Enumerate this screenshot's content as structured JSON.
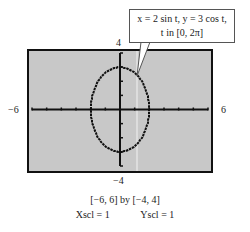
{
  "chart_data": {
    "type": "line",
    "title": "",
    "callout": {
      "line1": "x = 2 sin t, y = 3 cos t,",
      "line2": "t in [0, 2π]"
    },
    "parametric": {
      "x": "2 sin t",
      "y": "3 cos t",
      "t_range": [
        0,
        6.2832
      ]
    },
    "xlim": [
      -6,
      6
    ],
    "ylim": [
      -4,
      4
    ],
    "xscl": 1,
    "yscl": 1,
    "tick_labels": {
      "xmin": "−6",
      "xmax": "6",
      "ymin": "−4",
      "ymax": "4"
    },
    "window_caption": "[−6, 6]  by  [−4, 4]",
    "scale_caption_x": "Xscl = 1",
    "scale_caption_y": "Yscl = 1",
    "colors": {
      "screen": "#c8c8c8",
      "curve": "#111111",
      "frame": "#111111"
    }
  }
}
